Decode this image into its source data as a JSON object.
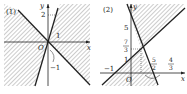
{
  "panels": [
    {
      "label": "(1)",
      "axes": {
        "x": "x",
        "y": "y",
        "origin": "O"
      },
      "ticks": {
        "y_top": "2",
        "x_right": "1",
        "annot": "−1"
      }
    },
    {
      "label": "(2)",
      "axes": {
        "x": "x",
        "y": "y",
        "origin": "O"
      },
      "ticks": {
        "y5": "5",
        "y73_num": "7",
        "y73_den": "3",
        "y1": "1",
        "xm1": "−1",
        "x52_num": "5",
        "x52_den": "2",
        "x43_num": "4",
        "x43_den": "3"
      }
    }
  ],
  "colors": {
    "line": "#222222",
    "hatch": "#9a9a9a"
  }
}
